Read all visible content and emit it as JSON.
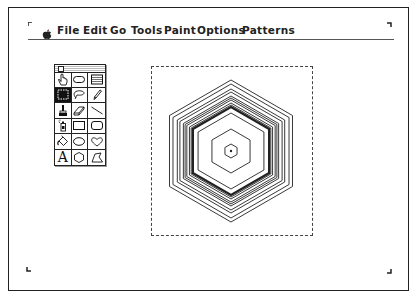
{
  "menubar": {
    "apple_icon": "apple-icon",
    "items": [
      {
        "label": "File",
        "x": 57
      },
      {
        "label": "Edit",
        "x": 83
      },
      {
        "label": "Go",
        "x": 110
      },
      {
        "label": "Tools",
        "x": 131
      },
      {
        "label": "Paint",
        "x": 164
      },
      {
        "label": "Options",
        "x": 197
      },
      {
        "label": "Patterns",
        "x": 242
      }
    ]
  },
  "tool_palette": {
    "selected_tool": "select",
    "tools": [
      {
        "name": "browse",
        "icon": "hand-icon"
      },
      {
        "name": "button",
        "icon": "rounded-rect-button-icon"
      },
      {
        "name": "field",
        "icon": "field-lines-icon"
      },
      {
        "name": "select",
        "icon": "marquee-select-icon"
      },
      {
        "name": "lasso",
        "icon": "lasso-icon"
      },
      {
        "name": "pencil",
        "icon": "pencil-icon"
      },
      {
        "name": "brush",
        "icon": "brush-icon"
      },
      {
        "name": "eraser",
        "icon": "eraser-icon"
      },
      {
        "name": "line",
        "icon": "line-icon"
      },
      {
        "name": "spray",
        "icon": "spray-can-icon"
      },
      {
        "name": "rectangle",
        "icon": "rectangle-icon"
      },
      {
        "name": "round-rect",
        "icon": "rounded-rectangle-icon"
      },
      {
        "name": "bucket",
        "icon": "paint-bucket-icon"
      },
      {
        "name": "oval",
        "icon": "oval-icon"
      },
      {
        "name": "curve",
        "icon": "curve-icon"
      },
      {
        "name": "text",
        "icon": "text-icon",
        "glyph": "A"
      },
      {
        "name": "regular-polygon",
        "icon": "hexagon-icon"
      },
      {
        "name": "polygon",
        "icon": "polygon-icon"
      }
    ]
  },
  "canvas": {
    "selection": {
      "x": 151,
      "y": 66,
      "width": 162,
      "height": 170,
      "style": "dashed"
    },
    "drawing": {
      "shape": "concentric-hexagons",
      "center": [
        80,
        85
      ],
      "radii": [
        7,
        22,
        38,
        44,
        46,
        48,
        51,
        53,
        55,
        59,
        62,
        67,
        71
      ],
      "thick_index": 3,
      "center_dot": true
    }
  },
  "colors": {
    "ink": "#222222",
    "background": "#ffffff"
  }
}
